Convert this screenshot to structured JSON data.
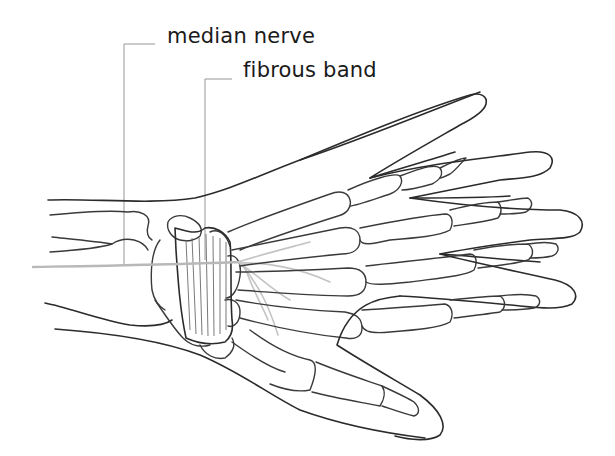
{
  "figure": {
    "labels": [
      {
        "id": "median-nerve",
        "text": "median nerve"
      },
      {
        "id": "fibrous-band",
        "text": "fibrous band"
      }
    ],
    "colors": {
      "outline": "#2b2b2b",
      "nerve": "#b8b8b8",
      "leader_line": "#8a8a8a",
      "background": "#ffffff"
    }
  }
}
